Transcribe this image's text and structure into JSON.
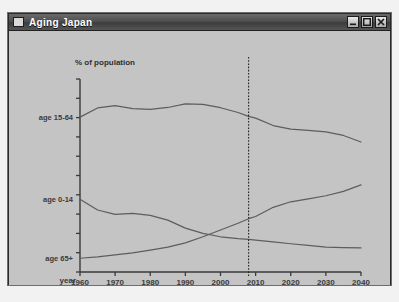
{
  "window": {
    "title": "Aging Japan",
    "icon": "window-app-icon",
    "buttons": [
      {
        "name": "minimize-button",
        "label": "Minimize",
        "glyph": "minimize-icon"
      },
      {
        "name": "maximize-button",
        "label": "Maximize",
        "glyph": "maximize-icon"
      },
      {
        "name": "close-button",
        "label": "Close",
        "glyph": "close-icon"
      }
    ]
  },
  "colors": {
    "window_frame": "#2a2a2a",
    "titlebar_dark": "#3d3d3d",
    "titlebar_light": "#6a6a6a",
    "client_background": "#c4c4c4",
    "axis": "#3a3a3a",
    "line": "#5d5d5d",
    "marker_line": "#1e1e1e",
    "label_text": "#3b3b3b",
    "title_text": "#ffffff"
  },
  "chart_data": {
    "type": "line",
    "title": "",
    "ylabel": "% of population",
    "xlabel": "year",
    "xlim": [
      1960,
      2040
    ],
    "ylim": [
      0,
      80
    ],
    "grid": false,
    "legend_position": "inline-left",
    "y_tick_count": 10,
    "y_ticks_labeled": false,
    "x_tick_labels": [
      "1960",
      "1970",
      "1980",
      "1990",
      "2000",
      "2010",
      "2020",
      "2030",
      "2040"
    ],
    "x_ticks": [
      1960,
      1970,
      1980,
      1990,
      2000,
      2010,
      2020,
      2030,
      2040
    ],
    "annotations": [
      {
        "name": "present-year-marker",
        "type": "vertical-dashed-line",
        "x": 2008,
        "label": ""
      }
    ],
    "series": [
      {
        "name": "age 15-64",
        "label": "age 15-64",
        "x": [
          1960,
          1965,
          1970,
          1975,
          1980,
          1985,
          1990,
          1995,
          2000,
          2005,
          2008,
          2010,
          2015,
          2020,
          2025,
          2030,
          2035,
          2040
        ],
        "values": [
          64.2,
          68.0,
          69.0,
          67.7,
          67.4,
          68.2,
          69.7,
          69.5,
          68.1,
          66.1,
          64.5,
          63.8,
          60.7,
          59.2,
          58.7,
          58.1,
          56.6,
          53.9
        ]
      },
      {
        "name": "age 0-14",
        "label": "age 0-14",
        "x": [
          1960,
          1965,
          1970,
          1975,
          1980,
          1985,
          1990,
          1995,
          2000,
          2005,
          2008,
          2010,
          2015,
          2020,
          2025,
          2030,
          2035,
          2040
        ],
        "values": [
          30.2,
          25.7,
          23.9,
          24.3,
          23.5,
          21.5,
          18.2,
          16.0,
          14.6,
          13.8,
          13.5,
          13.2,
          12.5,
          11.7,
          11.0,
          10.3,
          10.1,
          10.0
        ]
      },
      {
        "name": "age 65+",
        "label": "age 65+",
        "x": [
          1960,
          1965,
          1970,
          1975,
          1980,
          1985,
          1990,
          1995,
          2000,
          2005,
          2008,
          2010,
          2015,
          2020,
          2025,
          2030,
          2035,
          2040
        ],
        "values": [
          5.7,
          6.3,
          7.1,
          7.9,
          9.1,
          10.3,
          12.1,
          14.6,
          17.4,
          20.2,
          22.1,
          23.0,
          26.8,
          29.1,
          30.3,
          31.6,
          33.4,
          36.1
        ]
      }
    ]
  }
}
